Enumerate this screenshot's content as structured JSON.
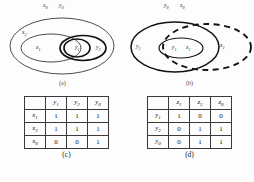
{
  "figure": {
    "panels": [
      {
        "id": "a",
        "caption": "(a)",
        "top_labels": [
          "x0",
          "y0"
        ],
        "top_labels_rendered": [
          {
            "base": "x",
            "sub": "0"
          },
          {
            "base": "y",
            "sub": "0"
          }
        ],
        "region_labels": [
          {
            "base": "x",
            "sub": "2"
          },
          {
            "base": "x",
            "sub": "1"
          },
          {
            "base": "y",
            "sub": "1"
          },
          {
            "base": "y",
            "sub": "2"
          }
        ]
      },
      {
        "id": "b",
        "caption": "(b)",
        "top_labels": [
          "y0",
          "x0"
        ],
        "top_labels_rendered": [
          {
            "base": "y",
            "sub": "0"
          },
          {
            "base": "x",
            "sub": "0"
          }
        ],
        "region_labels": [
          {
            "base": "y",
            "sub": "2"
          },
          {
            "base": "y",
            "sub": "1"
          },
          {
            "base": "x",
            "sub": "1"
          },
          {
            "base": "x",
            "sub": "2"
          }
        ]
      }
    ],
    "tables": [
      {
        "id": "c",
        "caption": "(c)",
        "corner": "",
        "col_headers": [
          {
            "base": "y",
            "sub": "1"
          },
          {
            "base": "y",
            "sub": "2"
          },
          {
            "base": "y",
            "sub": "0"
          }
        ],
        "row_headers": [
          {
            "base": "x",
            "sub": "1"
          },
          {
            "base": "x",
            "sub": "2"
          },
          {
            "base": "x",
            "sub": "0"
          }
        ],
        "rows": [
          [
            "1",
            "1",
            "1"
          ],
          [
            "1",
            "1",
            "1"
          ],
          [
            "0",
            "0",
            "1"
          ]
        ]
      },
      {
        "id": "d",
        "caption": "(d)",
        "corner": "",
        "col_headers": [
          {
            "base": "z",
            "sub": "1"
          },
          {
            "base": "z",
            "sub": "2"
          },
          {
            "base": "z",
            "sub": "0"
          }
        ],
        "row_headers": [
          {
            "base": "y",
            "sub": "1"
          },
          {
            "base": "y",
            "sub": "2"
          },
          {
            "base": "y",
            "sub": "0"
          }
        ],
        "rows": [
          [
            "1",
            "0",
            "0"
          ],
          [
            "0",
            "1",
            "1"
          ],
          [
            "0",
            "1",
            "1"
          ]
        ]
      }
    ],
    "colors": {
      "stroke": "#1a1a1a",
      "background": "#ffffff",
      "text": "#1a1a1a"
    }
  }
}
